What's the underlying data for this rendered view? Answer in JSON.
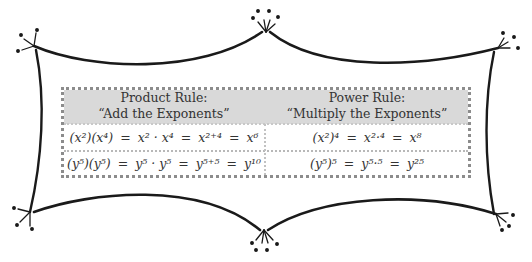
{
  "table": {
    "headers": [
      {
        "title": "Product Rule:",
        "subtitle": "“Add the Exponents”"
      },
      {
        "title": "Power Rule:",
        "subtitle": "“Multiply the Exponents”"
      }
    ],
    "rows": [
      {
        "product": {
          "lhs": "(x²)(x⁴)",
          "step1": "x² · x⁴",
          "step2": "x²⁺⁴",
          "result": "x⁶"
        },
        "power": {
          "lhs": "(x²)⁴",
          "step1": "x²·⁴",
          "result": "x⁸"
        }
      },
      {
        "product": {
          "lhs": "(y⁵)(y⁵)",
          "step1": "y⁵ · y⁵",
          "step2": "y⁵⁺⁵",
          "result": "y¹⁰"
        },
        "power": {
          "lhs": "(y⁵)⁵",
          "step1": "y⁵·⁵",
          "result": "y²⁵"
        }
      }
    ],
    "equals": "="
  },
  "colors": {
    "header_bg": "#d9d9d9",
    "border": "#8c8c8c",
    "frame": "#1a1a1a"
  }
}
